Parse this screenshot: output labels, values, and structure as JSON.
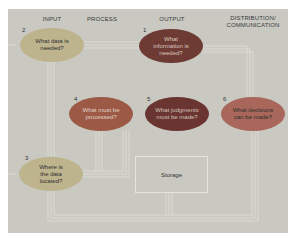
{
  "diagram": {
    "headers": {
      "input": "INPUT",
      "process": "PROCESS",
      "output": "OUTPUT",
      "distribution_line1": "DISTRIBUTION/",
      "distribution_line2": "COMMUNICATION"
    },
    "nodes": [
      {
        "number": "1",
        "text": "What information is needed?",
        "column": "OUTPUT",
        "color": "#6e3a34",
        "text_color": "#d9c8c0"
      },
      {
        "number": "2",
        "text": "What data is needed?",
        "column": "INPUT",
        "color": "#bdb48e",
        "text_color": "#2f2f2f"
      },
      {
        "number": "3",
        "text": "Where is the data located?",
        "column": "INPUT",
        "color": "#bdb48e",
        "text_color": "#2f2f2f"
      },
      {
        "number": "4",
        "text": "What must be processed?",
        "column": "PROCESS",
        "color": "#9c5a46",
        "text_color": "#e0d4c8"
      },
      {
        "number": "5",
        "text": "What judgments must be made?",
        "column": "OUTPUT",
        "color": "#6a3430",
        "text_color": "#d4c2b8"
      },
      {
        "number": "6",
        "text": "What decisions can be made?",
        "column": "DISTRIBUTION/COMMUNICATION",
        "color": "#a8675a",
        "text_color": "#2f2f2f"
      }
    ],
    "storage_label": "Storage",
    "colors": {
      "background": "#c9c9c2",
      "flow_lines": "#e6e6e0"
    }
  }
}
